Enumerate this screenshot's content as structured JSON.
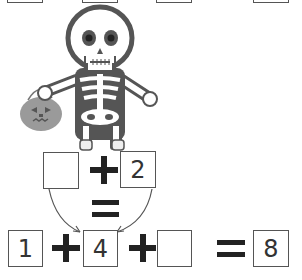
{
  "top_row": {
    "boxes": [
      {
        "value": ""
      },
      {
        "value": ""
      },
      {
        "value": ""
      },
      {
        "value": ""
      }
    ]
  },
  "illustration": {
    "subject": "skeleton-holding-pumpkin-pail",
    "colors": {
      "outline": "#555555",
      "bone": "#ffffff",
      "pumpkin": "#9a9a9a",
      "eye": "#333333"
    }
  },
  "middle_equation": {
    "left_box": "",
    "operator": "+",
    "right_box": "2",
    "equals": "="
  },
  "bottom_equation": {
    "box1": "1",
    "op1": "+",
    "box2": "4",
    "op2": "+",
    "box3": "",
    "equals": "=",
    "result": "8"
  }
}
